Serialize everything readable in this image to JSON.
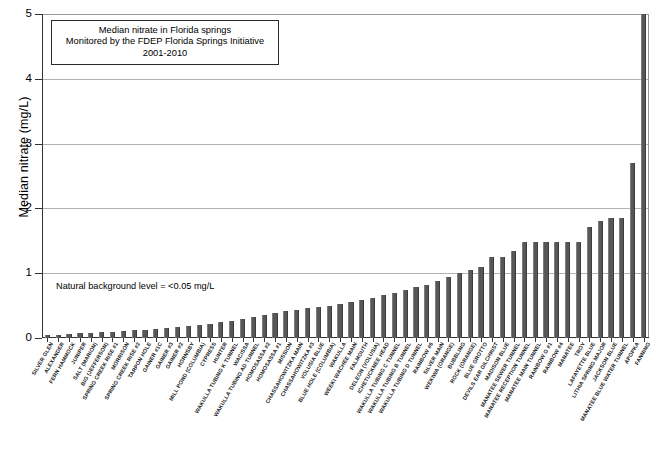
{
  "chart_data": {
    "type": "bar",
    "title": "Median nitrate in Florida springs",
    "title_lines": [
      "Median nitrate in Florida springs",
      "Monitored by the FDEP Florida Springs Initiative",
      "2001-2010"
    ],
    "xlabel": "",
    "ylabel": "Median nitrate (mg/L)",
    "ylim": [
      0,
      5
    ],
    "yticks": [
      0,
      1,
      2,
      3,
      4,
      5
    ],
    "ytick_labels": [
      "0",
      "1",
      "2",
      "3",
      "4",
      "5"
    ],
    "grid": true,
    "grid_axis": "y",
    "legend": false,
    "bar_color": "#575757",
    "annotation": "Natural background level = <0.05 mg/L",
    "note": "Final bar (FANNING) is clipped at the top of the axis; its value exceeds 5 mg/L.",
    "categories": [
      "SILVER GLEN",
      "ALEXANDER",
      "FERN HAMMOCK",
      "JUNIPER",
      "SALT (MARION)",
      "BIG (JEFFERSON)",
      "SPRING CREEK RISE #1",
      "MORRISON",
      "SPRING CREEK RISE #2",
      "TARPON HOLE",
      "GAINER #1C",
      "GAINER #3",
      "GAINER #2",
      "HORNSBY",
      "MILL POND (COLUMBIA)",
      "CYPRESS",
      "HUNTER",
      "WAKULLA TUBING K TUNNEL",
      "WACISSA",
      "WAKULLA TUBING AD TUNNEL",
      "HOMOSASSA #2",
      "HOMOSASSA #1",
      "MISSION",
      "CHASSAHOWITZKA MAIN",
      "CHASSAHOWITZKA #3",
      "VOLUSIA BLUE",
      "BLUE HOLE (COLUMBIA)",
      "WAKULLA",
      "WEEKI WACHEE MAIN",
      "FALMOUTH",
      "DELEON (VOLUSIA)",
      "ICHETUCKNEE HEAD",
      "WAKULLA TUBING C TUNNEL",
      "WAKULLA TUBING B TUNNEL",
      "WAKULLA TUBING D TUNNEL",
      "RAINBOW #6",
      "SILVER MAIN",
      "WEKIWA (ORANGE)",
      "BUBBLING",
      "ROCK (ORANGE)",
      "BLUE GROTTO",
      "DEVILS EAR GILCHRIST",
      "MADISON BLUE",
      "MANATEE SEWER TUNNEL",
      "MANATEE RECEPTION TUNNEL",
      "MANATEE MAIN TUNNEL",
      "RAINBOW G #1",
      "RAINBOW #4",
      "MANATEE",
      "TROY",
      "LAFAYETTE BLUE",
      "LITHIA SPRING MAJOR",
      "JACKSON BLUE",
      "MANATEE BLUE WATER TUNNEL",
      "APOPKA",
      "FANNING"
    ],
    "values": [
      0.04,
      0.05,
      0.06,
      0.07,
      0.08,
      0.09,
      0.1,
      0.11,
      0.12,
      0.13,
      0.14,
      0.15,
      0.17,
      0.18,
      0.2,
      0.22,
      0.25,
      0.27,
      0.3,
      0.33,
      0.36,
      0.39,
      0.42,
      0.44,
      0.46,
      0.48,
      0.5,
      0.52,
      0.55,
      0.58,
      0.62,
      0.66,
      0.7,
      0.74,
      0.78,
      0.82,
      0.88,
      0.94,
      1.0,
      1.05,
      1.1,
      1.25,
      1.25,
      1.35,
      1.48,
      1.48,
      1.48,
      1.48,
      1.48,
      1.48,
      1.72,
      1.8,
      1.85,
      1.85,
      2.7,
      5.0
    ],
    "values_tail_detail": {
      "3.30": "LITHIA SPRING MAJOR region",
      "3.75": "JACKSON BLUE region",
      "4.45": "MANATEE BLUE WATER TUNNEL / APOPKA region"
    }
  },
  "axis": {
    "y_title": "Median nitrate (mg/L)",
    "y_ticks": [
      "0",
      "1",
      "2",
      "3",
      "4",
      "5"
    ]
  }
}
